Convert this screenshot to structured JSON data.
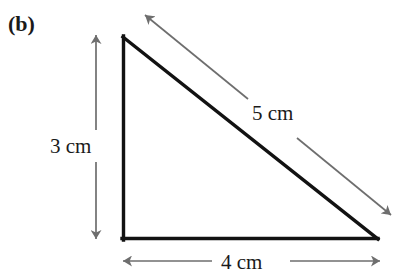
{
  "figure": {
    "part_label": "(b)",
    "background_color": "#ffffff",
    "shape_color": "#121212",
    "dimension_arrow_color": "#6e6e6e"
  },
  "triangle": {
    "vertices": {
      "apex": {
        "x": 122,
        "y": 36
      },
      "bottom_left": {
        "x": 122,
        "y": 240
      },
      "bottom_right": {
        "x": 378,
        "y": 240
      }
    },
    "stroke_width": 3
  },
  "dimensions": {
    "height": {
      "label": "3 cm",
      "value": 3,
      "unit": "cm",
      "orientation": "vertical",
      "arrow": {
        "x": 96,
        "y_top": 34,
        "y_bottom": 240
      },
      "gap": {
        "y_start": 130,
        "y_end": 162
      }
    },
    "base": {
      "label": "4 cm",
      "value": 4,
      "unit": "cm",
      "orientation": "horizontal",
      "arrow": {
        "y": 261,
        "x_left": 122,
        "x_right": 380
      },
      "gap": {
        "x_start": 212,
        "x_end": 290
      }
    },
    "hypotenuse": {
      "label": "5 cm",
      "value": 5,
      "unit": "cm",
      "orientation": "diagonal",
      "arrow": {
        "x_start": 392,
        "y_start": 216,
        "x_end": 144,
        "y_end": 14
      },
      "gap": {
        "x_start": 297,
        "y_start": 138,
        "x_end": 248,
        "y_end": 99
      }
    }
  }
}
